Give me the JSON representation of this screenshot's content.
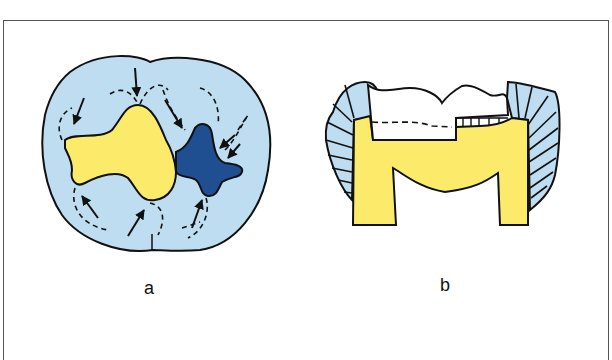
{
  "figure": {
    "panels": [
      {
        "id": "a",
        "label": "a",
        "description": "Occlusal view of tooth with yellow and dark-blue restorations; arrows and dashed lines indicate cusp stress paths"
      },
      {
        "id": "b",
        "label": "b",
        "description": "Cross-section of tooth with enamel (light blue, striated), dentin (yellow), and cavity preparation outline"
      }
    ],
    "colors": {
      "enamel": "#BEDDF0",
      "dentin_restoration": "#FCEB6A",
      "dark_restoration": "#1F4F91",
      "outline": "#111111",
      "frame": "#555555"
    }
  }
}
